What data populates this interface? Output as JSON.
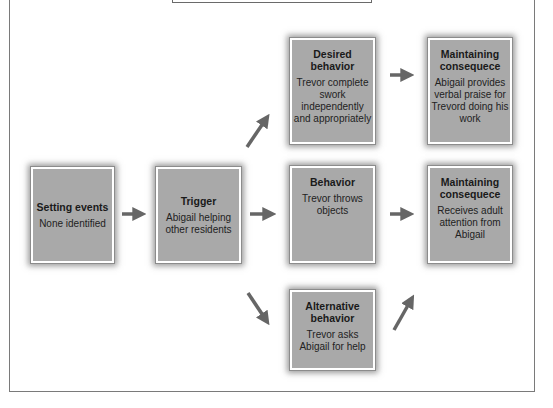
{
  "diagram": {
    "boxes": {
      "setting_events": {
        "title": "Setting events",
        "body": "None identified"
      },
      "trigger": {
        "title": "Trigger",
        "body": "Abigail helping other residents"
      },
      "desired_behavior": {
        "title": "Desired behavior",
        "body": "Trevor complete swork independently and appropriately"
      },
      "behavior": {
        "title": "Behavior",
        "body": "Trevor throws objects"
      },
      "alternative_behavior": {
        "title": "Alternative behavior",
        "body": "Trevor asks Abigail for help"
      },
      "maintaining_consequence_desired": {
        "title": "Maintaining consequece",
        "body": "Abigail provides verbal praise for Trevord doing his work"
      },
      "maintaining_consequence_problem": {
        "title": "Maintaining consequece",
        "body": "Receives adult attention from Abigail"
      }
    },
    "colors": {
      "box_fill": "#a9a9a9",
      "arrow": "#666666",
      "frame": "#7a7a7a"
    }
  }
}
